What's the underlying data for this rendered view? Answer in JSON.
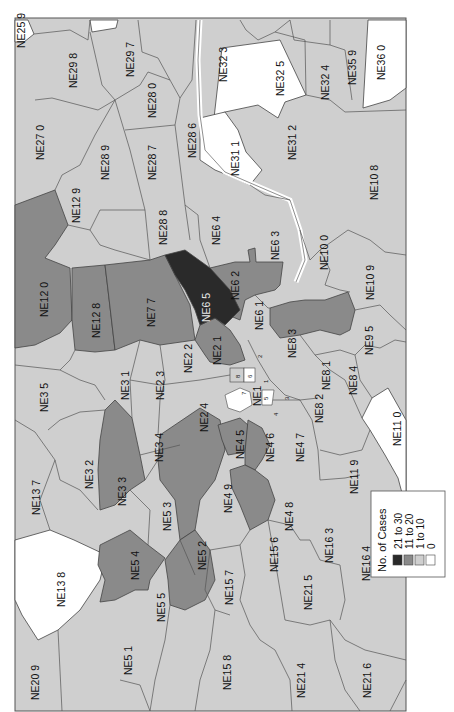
{
  "map": {
    "title": "No. of Cases by postcode district",
    "orientation": "rotated 90 degrees counter-clockwise",
    "colors": {
      "c21_30": "#2a2a2a",
      "c11_20": "#8a8a8a",
      "c1_10": "#cfcfcf",
      "c0": "#ffffff",
      "border": "#444444",
      "river": "#ffffff"
    },
    "legend": {
      "title": "No. of Cases",
      "items": [
        {
          "label": "21 to 30",
          "color": "#2a2a2a"
        },
        {
          "label": "11 to 20",
          "color": "#8a8a8a"
        },
        {
          "label": "1 to 10",
          "color": "#cfcfcf"
        },
        {
          "label": "0",
          "color": "#ffffff"
        }
      ]
    },
    "districts": {
      "NE25_9": "NE25 9",
      "NE29_8": "NE29 8",
      "NE29_7": "NE29 7",
      "NE28_0": "NE28 0",
      "NE32_3": "NE32 3",
      "NE32_5": "NE32 5",
      "NE32_4": "NE32 4",
      "NE35_9": "NE35 9",
      "NE36_0": "NE36 0",
      "NE27_0": "NE27 0",
      "NE28_9": "NE28 9",
      "NE28_7": "NE28 7",
      "NE28_6": "NE28 6",
      "NE31_1": "NE31 1",
      "NE31_2": "NE31 2",
      "NE10_8": "NE10 8",
      "NE12_9": "NE12 9",
      "NE28_8": "NE28 8",
      "NE6_4": "NE6 4",
      "NE6_3": "NE6 3",
      "NE10_0": "NE10 0",
      "NE12_0": "NE12 0",
      "NE12_8": "NE12 8",
      "NE7_7": "NE7 7",
      "NE6_5": "NE6 5",
      "NE6_2": "NE6 2",
      "NE6_1": "NE6 1",
      "NE10_9": "NE10 9",
      "NE2_1": "NE2 1",
      "NE8_3": "NE8 3",
      "NE9_5": "NE9 5",
      "NE3_5": "NE3 5",
      "NE3_1": "NE3 1",
      "NE2_3": "NE2 3",
      "NE2_2": "NE2 2",
      "NE8_1": "NE8 1",
      "NE8_4": "NE8 4",
      "NE2_4": "NE2 4",
      "NE1": "NE1",
      "NE8_2": "NE8 2",
      "NE11_0": "NE11 0",
      "NE3_2": "NE3 2",
      "NE3_4": "NE3 4",
      "NE4_5": "NE4 5",
      "NE4_6": "NE4 6",
      "NE4_7": "NE4 7",
      "NE13_7": "NE13 7",
      "NE3_3": "NE3 3",
      "NE4_9": "NE4 9",
      "NE11_9": "NE11 9",
      "NE5_3": "NE5 3",
      "NE4_8": "NE4 8",
      "NE13_8": "NE13 8",
      "NE5_4": "NE5 4",
      "NE5_2": "NE5 2",
      "NE15_6": "NE15 6",
      "NE16_3": "NE16 3",
      "NE5_5": "NE5 5",
      "NE15_7": "NE15 7",
      "NE21_5": "NE21 5",
      "NE16_4": "NE16 4",
      "NE20_9": "NE20 9",
      "NE5_1": "NE5 1",
      "NE15_8": "NE15 8",
      "NE21_4": "NE21 4",
      "NE21_6": "NE21 6"
    },
    "small_labels": [
      "1",
      "2",
      "3",
      "4",
      "5",
      "6",
      "7",
      "8"
    ]
  }
}
